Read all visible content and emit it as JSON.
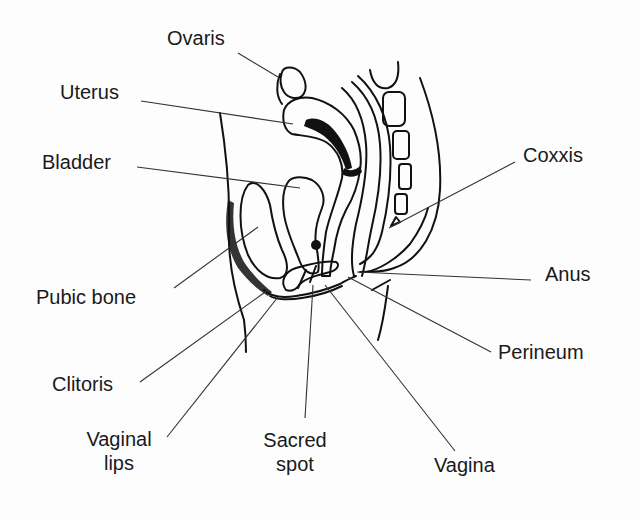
{
  "diagram": {
    "type": "anatomical-line-drawing",
    "line_color": "#111111",
    "background_color": "#fdfdfd",
    "labels": [
      {
        "id": "ovaris",
        "text": "Ovaris",
        "x": 167,
        "y": 26
      },
      {
        "id": "uterus",
        "text": "Uterus",
        "x": 60,
        "y": 80
      },
      {
        "id": "bladder",
        "text": "Bladder",
        "x": 42,
        "y": 150
      },
      {
        "id": "coxxis",
        "text": "Coxxis",
        "x": 523,
        "y": 143
      },
      {
        "id": "pubic_bone",
        "text": "Pubic bone",
        "x": 36,
        "y": 285
      },
      {
        "id": "anus",
        "text": "Anus",
        "x": 545,
        "y": 262
      },
      {
        "id": "perineum",
        "text": "Perineum",
        "x": 498,
        "y": 340
      },
      {
        "id": "clitoris",
        "text": "Clitoris",
        "x": 52,
        "y": 372
      },
      {
        "id": "vaginal_lips",
        "text_lines": [
          "Vaginal",
          "lips"
        ],
        "x": 77,
        "y": 427
      },
      {
        "id": "sacred_spot",
        "text_lines": [
          "Sacred",
          "spot"
        ],
        "x": 266,
        "y": 428
      },
      {
        "id": "vagina",
        "text": "Vagina",
        "x": 434,
        "y": 453
      }
    ],
    "leader_lines": [
      {
        "to": "ovaris",
        "from": [
          238,
          53
        ],
        "end": [
          278,
          77
        ]
      },
      {
        "to": "uterus",
        "from": [
          141,
          101
        ],
        "end": [
          293,
          124
        ]
      },
      {
        "to": "bladder",
        "from": [
          137,
          167
        ],
        "end": [
          300,
          188
        ]
      },
      {
        "to": "coxxis",
        "from": [
          515,
          162
        ],
        "end": [
          389,
          228
        ]
      },
      {
        "to": "pubic_bone",
        "from": [
          174,
          288
        ],
        "end": [
          258,
          227
        ]
      },
      {
        "to": "anus",
        "from": [
          531,
          280
        ],
        "end": [
          357,
          272
        ]
      },
      {
        "to": "perineum",
        "from": [
          491,
          352
        ],
        "end": [
          348,
          277
        ]
      },
      {
        "to": "clitoris",
        "from": [
          140,
          382
        ],
        "end": [
          268,
          290
        ]
      },
      {
        "to": "vaginal_lips",
        "from": [
          167,
          437
        ],
        "end": [
          278,
          297
        ]
      },
      {
        "to": "sacred_spot",
        "from": [
          305,
          418
        ],
        "end": [
          313,
          285
        ]
      },
      {
        "to": "vagina",
        "from": [
          455,
          451
        ],
        "end": [
          325,
          285
        ]
      }
    ]
  }
}
